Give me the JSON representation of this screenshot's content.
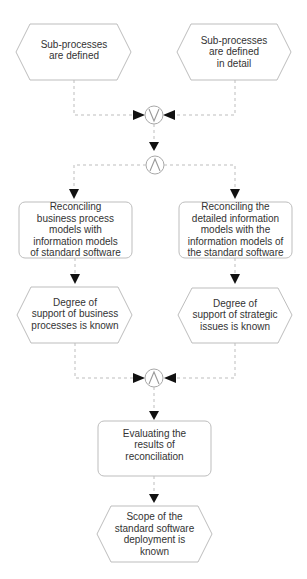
{
  "diagram": {
    "type": "EPC process chain",
    "events": {
      "subprocesses_defined": "Sub-processes\nare defined",
      "subprocesses_defined_detail": "Sub-processes\nare defined\nin detail",
      "degree_business": "Degree of\nsupport of business\nprocesses is known",
      "degree_strategic": "Degree of\nsupport of strategic\nissues is known",
      "scope_known": "Scope of the\nstandard software\ndeployment is\nknown"
    },
    "functions": {
      "reconcile_business": "Reconciling\nbusiness process\nmodels with\ninformation models\nof standard software",
      "reconcile_detailed": "Reconciling the\ndetailed information\nmodels with the\ninformation models of\nthe standard software",
      "evaluate": "Evaluating the\nresults of\nreconciliation"
    },
    "connectors": {
      "or_join": "∨",
      "and_split": "∧",
      "and_join": "∧"
    },
    "colors": {
      "shape_border": "#bdbdbd",
      "arrow": "#111111",
      "text": "#333333"
    }
  }
}
